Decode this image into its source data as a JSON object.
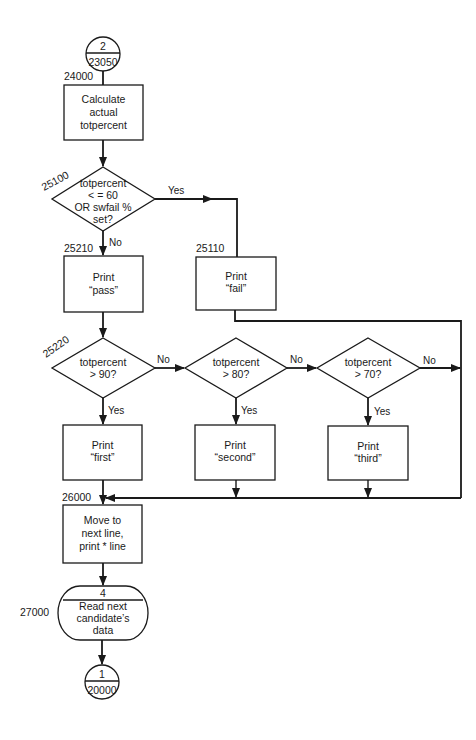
{
  "diagram": {
    "type": "flowchart",
    "start_connector": {
      "top": "2",
      "bottom": "23050"
    },
    "end_connector": {
      "top": "1",
      "bottom": "20000"
    },
    "nodes": {
      "calc": {
        "label": "24000",
        "lines": [
          "Calculate",
          "actual",
          "totpercent"
        ]
      },
      "decision_fail": {
        "label": "25100",
        "lines": [
          "totpercent",
          "< = 60",
          "OR swfail %",
          "set?"
        ],
        "yes": "Yes",
        "no": "No"
      },
      "print_pass": {
        "label": "25210",
        "lines": [
          "Print",
          "“pass”"
        ]
      },
      "print_fail": {
        "label": "25110",
        "lines": [
          "Print",
          "“fail”"
        ]
      },
      "decision_90": {
        "label": "25220",
        "lines": [
          "totpercent",
          "> 90?"
        ],
        "yes": "Yes",
        "no": "No"
      },
      "decision_80": {
        "lines": [
          "totpercent",
          "> 80?"
        ],
        "yes": "Yes",
        "no": "No"
      },
      "decision_70": {
        "lines": [
          "totpercent",
          "> 70?"
        ],
        "yes": "Yes",
        "no": "No"
      },
      "print_first": {
        "lines": [
          "Print",
          "“first”"
        ]
      },
      "print_second": {
        "lines": [
          "Print",
          "“second”"
        ]
      },
      "print_third": {
        "lines": [
          "Print",
          "“third”"
        ]
      },
      "junction": {
        "label": "26000"
      },
      "move_line": {
        "lines": [
          "Move to",
          "next line,",
          "print * line"
        ]
      },
      "read_next": {
        "label": "27000",
        "header": "4",
        "lines": [
          "Read next",
          "candidate’s",
          "data"
        ]
      }
    }
  }
}
